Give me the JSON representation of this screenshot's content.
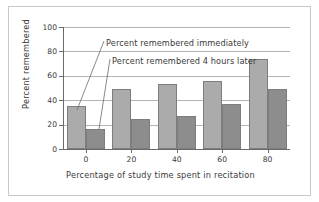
{
  "chart_data": {
    "type": "bar",
    "title": "",
    "xlabel": "Percentage of study time spent in recitation",
    "ylabel": "Percent remembered",
    "categories": [
      "0",
      "20",
      "40",
      "60",
      "80"
    ],
    "ylim": [
      0,
      100
    ],
    "yticks": [
      "0",
      "20",
      "40",
      "60",
      "80",
      "100"
    ],
    "grid": true,
    "legend_position": "annotations-inline",
    "series": [
      {
        "name": "Percent remembered immediately",
        "color": "#ababab",
        "values": [
          35,
          49,
          53,
          56,
          74
        ]
      },
      {
        "name": "Percent remembered 4 hours later",
        "color": "#8d8d8d",
        "values": [
          16,
          25,
          27,
          37,
          49
        ]
      }
    ],
    "annotations": [
      {
        "text": "Percent remembered immediately",
        "points_to": "series-1 bar at category 0"
      },
      {
        "text": "Percent remembered 4 hours later",
        "points_to": "series-2 bar at category 0"
      }
    ]
  },
  "axis": {
    "ylabel": "Percent remembered",
    "xlabel": "Percentage of study time spent in recitation"
  },
  "colors": {
    "bar_light": "#ababab",
    "bar_dark": "#8d8d8d",
    "bar_border": "#7d7d7d",
    "gridline": "#b4b4b4",
    "axis": "#6b6b6b",
    "text": "#3a3a3a",
    "frame": "#c9c9c9"
  }
}
